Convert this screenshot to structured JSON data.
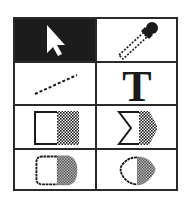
{
  "palette": {
    "name": "Tool Palette",
    "selected_tool": "select",
    "colors": {
      "border": "#2a2a2a",
      "selected_bg": "#1c1c1c",
      "bg": "#ffffff"
    },
    "tools": [
      {
        "id": "select",
        "icon": "arrow-pointer-icon",
        "selected": true
      },
      {
        "id": "eyedropper",
        "icon": "eyedropper-icon",
        "selected": false
      },
      {
        "id": "line",
        "icon": "line-icon",
        "selected": false
      },
      {
        "id": "text",
        "icon": "text-icon",
        "selected": false,
        "glyph": "T"
      },
      {
        "id": "rectangle",
        "icon": "rectangle-icon",
        "selected": false
      },
      {
        "id": "polygon",
        "icon": "polygon-icon",
        "selected": false
      },
      {
        "id": "rounded-rectangle",
        "icon": "rounded-rectangle-icon",
        "selected": false
      },
      {
        "id": "oval",
        "icon": "oval-icon",
        "selected": false
      }
    ]
  }
}
